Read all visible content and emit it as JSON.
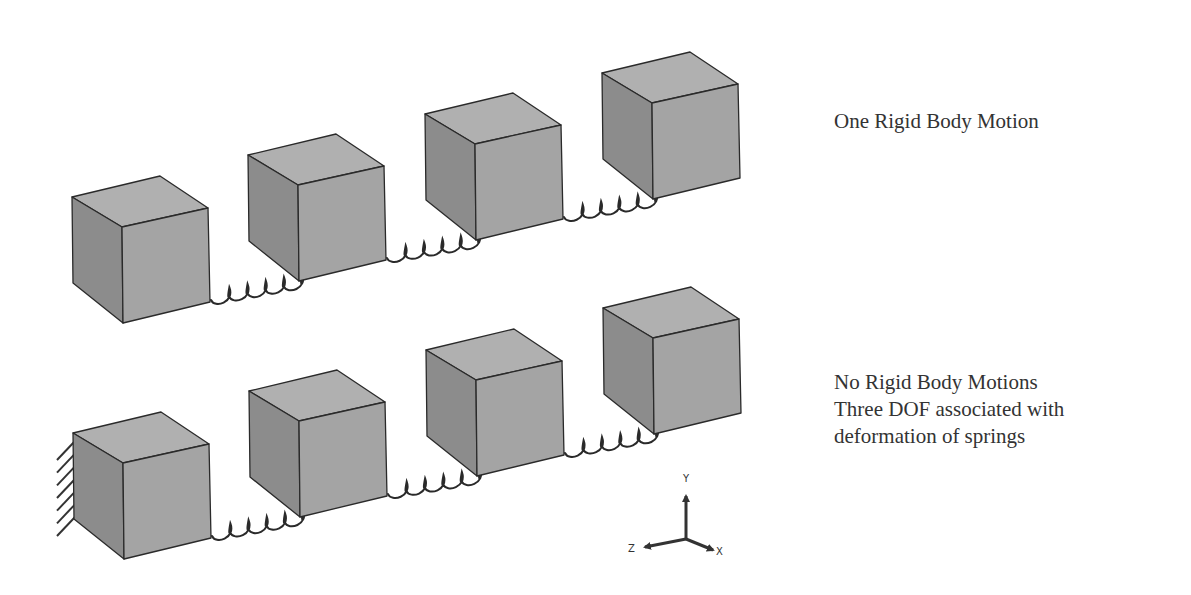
{
  "diagram": {
    "colors": {
      "background": "#ffffff",
      "cube_top": "#b0b0b0",
      "cube_front": "#a4a4a4",
      "cube_left": "#8c8c8c",
      "edge": "#2a2a2a",
      "spring": "#2a2a2a",
      "text": "#333333",
      "ground": "#333333"
    },
    "cube_shape": {
      "comment_units": "pixel offsets from top-left back corner A",
      "A": [
        0,
        0
      ],
      "B": [
        88,
        -21
      ],
      "C": [
        136,
        11
      ],
      "D": [
        50,
        30
      ],
      "E": [
        51,
        126
      ],
      "F": [
        138,
        105
      ],
      "G": [
        1,
        86
      ]
    },
    "rows": [
      {
        "id": "top-row",
        "label": "One Rigid Body Motion",
        "grounded": false,
        "cubes": [
          {
            "x": 72,
            "y": 197
          },
          {
            "x": 248,
            "y": 155
          },
          {
            "x": 425,
            "y": 114
          },
          {
            "x": 602,
            "y": 73
          }
        ]
      },
      {
        "id": "bottom-row",
        "label_lines": [
          "No Rigid Body Motions",
          "Three DOF associated with",
          "deformation of springs"
        ],
        "grounded": true,
        "cubes": [
          {
            "x": 73,
            "y": 433
          },
          {
            "x": 249,
            "y": 391
          },
          {
            "x": 426,
            "y": 350
          },
          {
            "x": 603,
            "y": 308
          }
        ]
      }
    ],
    "springs_per_row": 3,
    "spring_coils": 5,
    "axis_triad": {
      "origin": [
        686,
        539
      ],
      "y_tip": [
        686,
        496
      ],
      "z_tip": [
        645,
        547
      ],
      "x_tip": [
        713,
        550
      ],
      "labels": {
        "y": "Y",
        "z": "Z",
        "x": "X"
      }
    }
  },
  "captions": {
    "top": "One Rigid Body Motion",
    "bottom_line1": "No Rigid Body Motions",
    "bottom_line2": "Three DOF associated with",
    "bottom_line3": "deformation of springs"
  }
}
